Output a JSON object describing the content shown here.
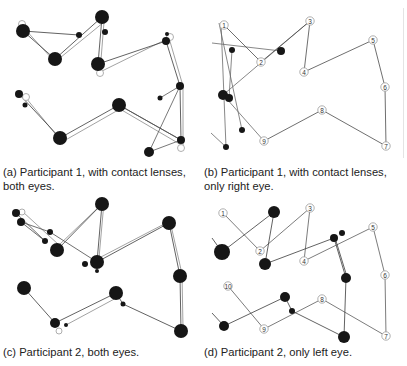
{
  "figure": {
    "panels": [
      {
        "id": "a",
        "caption": "(a) Participant 1, with contact lenses, both eyes.",
        "fixations": [
          [
            23,
            31,
            7
          ],
          [
            102,
            17,
            7
          ],
          [
            55,
            59,
            7
          ],
          [
            79,
            35,
            3
          ],
          [
            105,
            32,
            3
          ],
          [
            98,
            64,
            7
          ],
          [
            166,
            41,
            4
          ],
          [
            167,
            34,
            2
          ],
          [
            180,
            86,
            4
          ],
          [
            160,
            98,
            2.5
          ],
          [
            19,
            94,
            4
          ],
          [
            25,
            105,
            2.5
          ],
          [
            60,
            138,
            7
          ],
          [
            119,
            105,
            7
          ],
          [
            181,
            140,
            4
          ],
          [
            149,
            152,
            5
          ]
        ],
        "path_a": [
          [
            23,
            31
          ],
          [
            79,
            35
          ]
        ],
        "path_b": [
          [
            23,
            31
          ],
          [
            55,
            59
          ],
          [
            102,
            17
          ],
          [
            98,
            64
          ],
          [
            166,
            41
          ],
          [
            180,
            86
          ],
          [
            181,
            140
          ],
          [
            119,
            105
          ],
          [
            60,
            138
          ],
          [
            19,
            94
          ]
        ],
        "path_c": [
          [
            22,
            26
          ],
          [
            55,
            62
          ],
          [
            104,
            22
          ],
          [
            100,
            72
          ],
          [
            169,
            38
          ],
          [
            183,
            86
          ],
          [
            183,
            146
          ],
          [
            120,
            109
          ],
          [
            62,
            142
          ],
          [
            26,
            98
          ]
        ],
        "path_extra": [
          [
            160,
            98
          ],
          [
            180,
            86
          ],
          [
            149,
            152
          ],
          [
            181,
            140
          ],
          [
            119,
            105
          ]
        ],
        "markers": [
          [
            22,
            24
          ],
          [
            100,
            73
          ],
          [
            170,
            37
          ],
          [
            26,
            97
          ],
          [
            181,
            148
          ]
        ]
      },
      {
        "id": "b",
        "caption": "(b) Participant 1, with contact lenses, only right eye.",
        "numbered": [
          {
            "n": "1",
            "x": 224,
            "y": 25
          },
          {
            "n": "2",
            "x": 261,
            "y": 62
          },
          {
            "n": "3",
            "x": 310,
            "y": 21
          },
          {
            "n": "4",
            "x": 304,
            "y": 72
          },
          {
            "n": "5",
            "x": 373,
            "y": 40
          },
          {
            "n": "6",
            "x": 385,
            "y": 87
          },
          {
            "n": "7",
            "x": 386,
            "y": 146
          },
          {
            "n": "8",
            "x": 322,
            "y": 110
          },
          {
            "n": "9",
            "x": 264,
            "y": 141
          }
        ],
        "fixations": [
          [
            232,
            50,
            3
          ],
          [
            281,
            51,
            4
          ],
          [
            223,
            95,
            5
          ],
          [
            229,
            98,
            4
          ],
          [
            242,
            130,
            3
          ],
          [
            226,
            147,
            3
          ]
        ],
        "gaze_path": [
          [
            212,
            43
          ],
          [
            281,
            51
          ]
        ],
        "gaze_path2": [
          [
            221,
            23
          ],
          [
            226,
            147
          ]
        ],
        "gaze_path3": [
          [
            219,
            23
          ],
          [
            242,
            130
          ]
        ],
        "gaze_path4": [
          [
            232,
            50
          ],
          [
            229,
            98
          ]
        ],
        "gaze_path5": [
          [
            223,
            95
          ],
          [
            310,
            21
          ]
        ],
        "gaze_path6": [
          [
            211,
            133
          ],
          [
            226,
            147
          ]
        ],
        "gaze_path7": [
          [
            226,
            98
          ],
          [
            264,
            141
          ]
        ],
        "scan_path": [
          [
            224,
            25
          ],
          [
            261,
            62
          ],
          [
            310,
            21
          ],
          [
            304,
            72
          ],
          [
            373,
            40
          ],
          [
            385,
            87
          ],
          [
            386,
            146
          ],
          [
            322,
            110
          ],
          [
            264,
            141
          ]
        ]
      },
      {
        "id": "c",
        "caption": "(c) Participant 2, both eyes.",
        "fixations": [
          [
            16,
            213,
            4
          ],
          [
            21,
            222,
            4
          ],
          [
            50,
            232,
            3
          ],
          [
            45,
            241,
            3
          ],
          [
            57,
            250,
            7
          ],
          [
            102,
            204,
            7
          ],
          [
            97,
            262,
            7
          ],
          [
            85,
            264,
            3
          ],
          [
            97,
            271,
            2
          ],
          [
            169,
            223,
            7
          ],
          [
            180,
            276,
            7
          ],
          [
            181,
            331,
            7
          ],
          [
            24,
            288,
            7
          ],
          [
            116,
            293,
            7
          ],
          [
            123,
            304,
            2.5
          ],
          [
            55,
            323,
            5
          ],
          [
            66,
            325,
            2
          ]
        ],
        "path_a": [
          [
            21,
            222
          ],
          [
            50,
            232
          ],
          [
            97,
            262
          ]
        ],
        "path_b": [
          [
            16,
            213
          ],
          [
            45,
            241
          ]
        ],
        "path_c": [
          [
            57,
            250
          ],
          [
            102,
            204
          ],
          [
            97,
            262
          ],
          [
            169,
            223
          ],
          [
            180,
            276
          ],
          [
            181,
            331
          ],
          [
            123,
            304
          ],
          [
            116,
            293
          ],
          [
            55,
            323
          ],
          [
            24,
            288
          ]
        ],
        "path_d": [
          [
            23,
            212
          ],
          [
            59,
            245
          ],
          [
            104,
            202
          ],
          [
            99,
            258
          ],
          [
            170,
            221
          ],
          [
            182,
            274
          ],
          [
            183,
            328
          ]
        ],
        "path_e": [
          [
            66,
            325
          ],
          [
            118,
            297
          ]
        ],
        "path_f": [
          [
            21,
            222
          ],
          [
            45,
            241
          ]
        ],
        "markers": [
          [
            22,
            212
          ],
          [
            59,
            331
          ]
        ]
      },
      {
        "id": "d",
        "caption": "(d) Participant 2, only left eye.",
        "numbered": [
          {
            "n": "1",
            "x": 223,
            "y": 213
          },
          {
            "n": "2",
            "x": 260,
            "y": 251
          },
          {
            "n": "3",
            "x": 310,
            "y": 208
          },
          {
            "n": "4",
            "x": 304,
            "y": 261
          },
          {
            "n": "5",
            "x": 373,
            "y": 227
          },
          {
            "n": "6",
            "x": 385,
            "y": 275
          },
          {
            "n": "7",
            "x": 386,
            "y": 336
          },
          {
            "n": "8",
            "x": 322,
            "y": 299
          },
          {
            "n": "9",
            "x": 264,
            "y": 329
          },
          {
            "n": "10",
            "x": 228,
            "y": 286
          }
        ],
        "fixations": [
          [
            274,
            212,
            6
          ],
          [
            222,
            252,
            8
          ],
          [
            265,
            264,
            6
          ],
          [
            334,
            238,
            4
          ],
          [
            342,
            233,
            3
          ],
          [
            346,
            278,
            5
          ],
          [
            344,
            337,
            6
          ],
          [
            285,
            297,
            5
          ],
          [
            292,
            311,
            3
          ],
          [
            224,
            326,
            5
          ]
        ],
        "gaze_path": [
          [
            212,
            238
          ],
          [
            222,
            252
          ],
          [
            274,
            212
          ],
          [
            265,
            264
          ],
          [
            334,
            238
          ],
          [
            346,
            278
          ],
          [
            344,
            337
          ],
          [
            292,
            311
          ],
          [
            285,
            297
          ],
          [
            224,
            326
          ],
          [
            212,
            313
          ]
        ],
        "gaze_path2": [
          [
            336,
            241
          ],
          [
            348,
            280
          ]
        ],
        "scan_path": [
          [
            223,
            213
          ],
          [
            260,
            251
          ],
          [
            310,
            208
          ],
          [
            304,
            261
          ],
          [
            373,
            227
          ],
          [
            385,
            275
          ],
          [
            386,
            336
          ],
          [
            322,
            299
          ],
          [
            264,
            329
          ],
          [
            228,
            286
          ]
        ]
      }
    ]
  }
}
